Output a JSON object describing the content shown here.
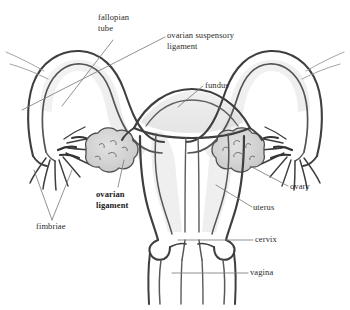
{
  "diagram": {
    "style": "hand-drawn pencil sketch, grayscale",
    "background_color": "#ffffff",
    "ink_color": "#4a4a4a",
    "ink_dark_color": "#3a3a3a",
    "shading_color": "#d8d8d8",
    "leader_line_color": "#7a7a7a",
    "text_color": "#2b2b2b"
  },
  "labels": {
    "fallopian_tube": "fallopian\ntube",
    "ovarian_suspensory_ligament": "ovarian suspensory\nligament",
    "fundus": "fundus",
    "ovary": "ovary",
    "uterus": "uterus",
    "cervix": "cervix",
    "vagina": "vagina",
    "ovarian_ligament": "ovarian\nligament",
    "fimbriae": "fimbriae"
  },
  "structures": [
    "fallopian tube",
    "ovarian suspensory ligament",
    "fundus",
    "ovary",
    "uterus",
    "cervix",
    "vagina",
    "ovarian ligament",
    "fimbriae"
  ]
}
